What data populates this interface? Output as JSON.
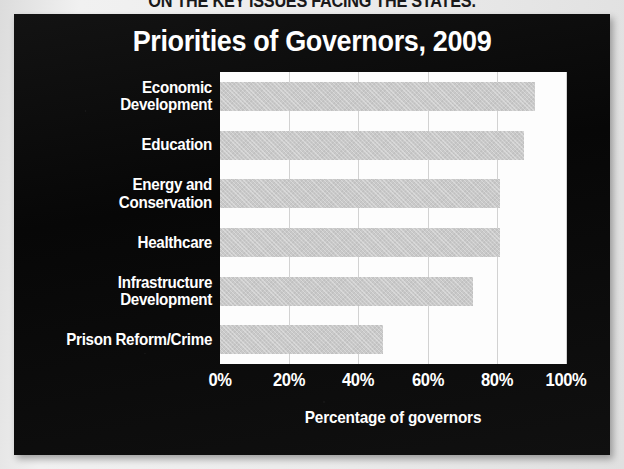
{
  "headline": "ON THE KEY ISSUES FACING THE STATES.",
  "panel": {
    "background_color": "#0b0b0b",
    "text_color": "#ffffff"
  },
  "chart_data": {
    "type": "bar",
    "orientation": "horizontal",
    "title": "Priorities of Governors, 2009",
    "xlabel": "Percentage of governors",
    "ylabel": "",
    "categories": [
      "Economic Development",
      "Education",
      "Energy and Conservation",
      "Healthcare",
      "Infrastructure Development",
      "Prison Reform/Crime"
    ],
    "category_lines": [
      [
        "Economic",
        "Development"
      ],
      [
        "Education"
      ],
      [
        "Energy and",
        "Conservation"
      ],
      [
        "Healthcare"
      ],
      [
        "Infrastructure",
        "Development"
      ],
      [
        "Prison Reform/Crime"
      ]
    ],
    "values": [
      91,
      88,
      81,
      81,
      73,
      47
    ],
    "xlim": [
      0,
      100
    ],
    "xticks": [
      0,
      20,
      40,
      60,
      80,
      100
    ],
    "xtick_labels": [
      "0%",
      "20%",
      "40%",
      "60%",
      "80%",
      "100%"
    ],
    "grid": true,
    "legend": false,
    "bar_color": "#c9c9c9",
    "plot_background": "#fdfdfd",
    "gridline_color": "#d2d2d2"
  }
}
